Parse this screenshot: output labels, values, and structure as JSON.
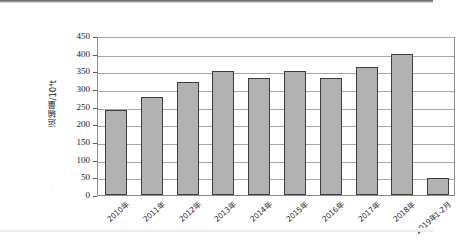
{
  "chart_data": {
    "type": "bar",
    "title": "",
    "subtitle": "",
    "xlabel": "",
    "ylabel": "运输量/10⁴t",
    "categories": [
      "2010年",
      "2011年",
      "2012年",
      "2013年",
      "2014年",
      "2015年",
      "2016年",
      "2017年",
      "2018年",
      "2019年1-2月"
    ],
    "values": [
      242,
      277,
      320,
      350,
      331,
      350,
      331,
      363,
      400,
      48
    ],
    "series": [
      {
        "name": "运输量",
        "values": [
          242,
          277,
          320,
          350,
          331,
          350,
          331,
          363,
          400,
          48
        ]
      }
    ],
    "ylim": [
      0,
      450
    ],
    "y_ticks": [
      0,
      50,
      100,
      150,
      200,
      250,
      300,
      350,
      400,
      450
    ],
    "y_tick_labels": [
      "0",
      "50",
      "100",
      "150",
      "200",
      "250",
      "300",
      "350",
      "400",
      "450"
    ],
    "grid": true,
    "grid_axis": "y",
    "legend": false,
    "legend_position": "none",
    "bar_fill_color": "#b2b2b2",
    "bar_border_color": "#3d3d3d",
    "gridline_color": "#a8a8a8",
    "axis_color": "#8c8c8c",
    "plot_background": "#ffffff",
    "figure_background": "#ffffff",
    "annotations": []
  }
}
